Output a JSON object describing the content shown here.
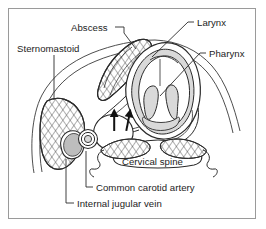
{
  "figure": {
    "type": "anatomical-diagram",
    "border_color": "#9a9a9a",
    "background_color": "#ffffff",
    "ink_color": "#2b2b2b",
    "shade_color": "#d9d9d9",
    "text_color": "#1c1c1c"
  },
  "labels": [
    {
      "id": "abscess",
      "text": "Abscess"
    },
    {
      "id": "sternomastoid",
      "text": "Sternomastoid"
    },
    {
      "id": "larynx",
      "text": "Larynx"
    },
    {
      "id": "pharynx",
      "text": "Pharynx"
    },
    {
      "id": "cervical_spine",
      "text": "Cervical spine"
    },
    {
      "id": "common_carotid_artery",
      "text": "Common carotid artery"
    },
    {
      "id": "internal_jugular_vein",
      "text": "Internal jugular vein"
    }
  ],
  "annotations": {
    "arrow_count": 2,
    "arrow_note": "Two solid black arrows indicating the abscess cavity displacing adjacent structures"
  },
  "structures": [
    {
      "name": "neck-outline",
      "fill": "none"
    },
    {
      "name": "sternomastoid-muscle",
      "texture": "cross-hatch"
    },
    {
      "name": "abscess-mass",
      "texture": "cross-hatch"
    },
    {
      "name": "larynx-cartilage",
      "fill": "#d9d9d9"
    },
    {
      "name": "pharynx-wall",
      "fill": "none"
    },
    {
      "name": "cervical-vertebra",
      "fill": "none"
    },
    {
      "name": "paraspinal-muscles",
      "texture": "cross-hatch"
    },
    {
      "name": "internal-jugular-vein",
      "shape": "oval"
    },
    {
      "name": "common-carotid-artery",
      "shape": "concentric-circles"
    }
  ]
}
